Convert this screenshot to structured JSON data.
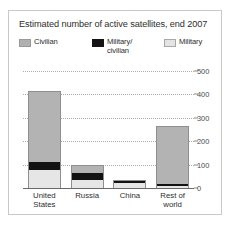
{
  "chart_data": {
    "type": "bar",
    "title": "Estimated number of active satellites, end 2007",
    "xlabel": "",
    "ylabel": "",
    "ylim": [
      0,
      500
    ],
    "yticks": [
      0,
      100,
      200,
      300,
      400,
      500
    ],
    "ytick_labels": [
      "0",
      "100",
      "200",
      "300",
      "400",
      "500"
    ],
    "grid": true,
    "stacked": true,
    "legend_position": "top",
    "categories": [
      "United States",
      "Russia",
      "China",
      "Rest of world"
    ],
    "category_labels": [
      "United\nStates",
      "Russia",
      "China",
      "Rest of\nworld"
    ],
    "series": [
      {
        "name": "Military",
        "color": "#e6e6e6",
        "values": [
          75,
          35,
          22,
          10
        ]
      },
      {
        "name": "Military/civilian",
        "color": "#121212",
        "values": [
          35,
          30,
          6,
          9
        ]
      },
      {
        "name": "Civilian",
        "color": "#b3b3b3",
        "values": [
          305,
          35,
          7,
          246
        ]
      }
    ],
    "totals": [
      415,
      100,
      35,
      265
    ],
    "legend": [
      {
        "key": "civilian",
        "label": "Civilian",
        "color": "#b0b0b0"
      },
      {
        "key": "military-civilian",
        "label": "Military/\ncivilian",
        "color": "#141414"
      },
      {
        "key": "military",
        "label": "Military",
        "color": "#e4e4e4"
      }
    ]
  },
  "source_note": ""
}
